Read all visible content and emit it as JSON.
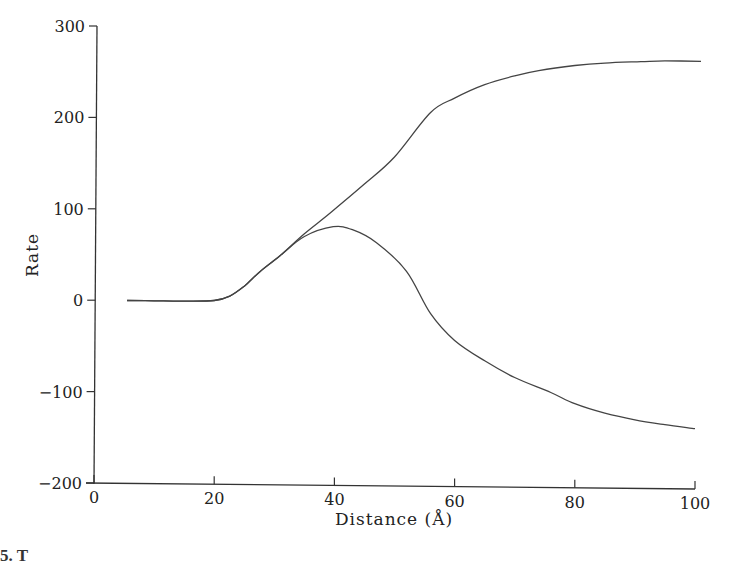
{
  "chart_data": {
    "type": "line",
    "title": "",
    "xlabel": "Distance (Å)",
    "ylabel": "Rate",
    "xlim": [
      0,
      100
    ],
    "ylim": [
      -200,
      300
    ],
    "xticks": [
      0,
      20,
      40,
      60,
      80,
      100
    ],
    "yticks": [
      -200,
      -100,
      0,
      100,
      200,
      300
    ],
    "xtick_labels": [
      "0",
      "20",
      "40",
      "60",
      "80",
      "100"
    ],
    "ytick_labels": [
      "−200",
      "−100",
      "0",
      "100",
      "200",
      "300"
    ],
    "grid": false,
    "legend": null,
    "series": [
      {
        "name": "upper curve",
        "x": [
          5.5,
          10,
          15,
          20,
          22.6,
          25,
          27.6,
          31,
          35,
          39.3,
          45,
          50,
          56,
          60,
          65,
          70,
          74,
          80,
          85,
          91,
          95,
          101
        ],
        "y": [
          0,
          0,
          0,
          1,
          6,
          17,
          33,
          51,
          75,
          98,
          130,
          160,
          209,
          225,
          240,
          250,
          256,
          262,
          265,
          267,
          268,
          268
        ]
      },
      {
        "name": "lower curve",
        "x": [
          5.5,
          10,
          15,
          20,
          22.6,
          25,
          27.6,
          31,
          35,
          39.8,
          43,
          47,
          52,
          56,
          60,
          65,
          70,
          76,
          80,
          85,
          90,
          95,
          100
        ],
        "y": [
          0,
          0,
          0,
          1,
          6,
          17,
          33,
          51,
          72,
          83,
          80,
          66,
          35,
          -11,
          -40,
          -62,
          -80,
          -96,
          -108,
          -118,
          -125,
          -130,
          -134
        ]
      }
    ],
    "caption_fragment": "5. T"
  }
}
